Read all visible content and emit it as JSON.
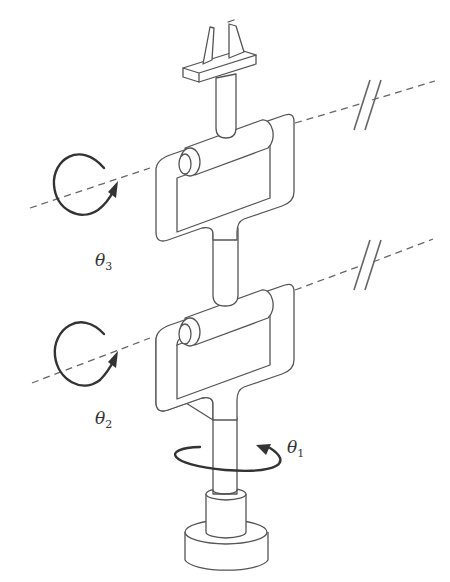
{
  "figure": {
    "line_color": "#555555",
    "labels": {
      "theta1": {
        "symbol": "θ",
        "subscript": "1"
      },
      "theta2": {
        "symbol": "θ",
        "subscript": "2"
      },
      "theta3": {
        "symbol": "θ",
        "subscript": "3"
      }
    },
    "axes": [
      {
        "name": "theta3-axis",
        "style": "dashed",
        "break_marker": "//"
      },
      {
        "name": "theta2-axis",
        "style": "dashed",
        "break_marker": "//"
      },
      {
        "name": "theta1-axis",
        "style": "vertical shaft"
      }
    ],
    "components": [
      "gripper",
      "upper yoke",
      "upper roller joint",
      "lower yoke",
      "lower roller joint",
      "vertical shaft",
      "base"
    ]
  }
}
